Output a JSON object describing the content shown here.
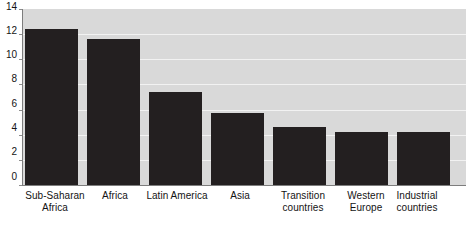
{
  "chart_data": {
    "type": "bar",
    "title": "",
    "subtitle": "",
    "xlabel": "",
    "ylabel": "",
    "categories": [
      "Sub-Saharan Africa",
      "Africa",
      "Latin America",
      "Asia",
      "Transition countries",
      "Western Europe",
      "Industrial countries"
    ],
    "values": [
      12.4,
      11.6,
      7.4,
      5.7,
      4.6,
      4.2,
      4.2
    ],
    "ylim": [
      0,
      14
    ],
    "yticks": [
      0,
      2,
      4,
      6,
      8,
      10,
      12,
      14
    ],
    "ytick_labels": [
      "0",
      "2",
      "4",
      "6",
      "8",
      "10",
      "12",
      "14"
    ],
    "grid": true,
    "grid_axis": "y",
    "legend": false,
    "legend_position": "none",
    "bar_color": "#231f20",
    "plot_background": "#d9d9d9",
    "gridline_color": "#f2f2f2",
    "axis_color": "#7d7d7d"
  },
  "category_label_lines": [
    [
      "Sub-Saharan",
      "Africa"
    ],
    [
      "Africa",
      ""
    ],
    [
      "Latin America",
      ""
    ],
    [
      "Asia",
      ""
    ],
    [
      "Transition",
      "countries"
    ],
    [
      "Western",
      "Europe"
    ],
    [
      "Industrial",
      "countries"
    ]
  ]
}
